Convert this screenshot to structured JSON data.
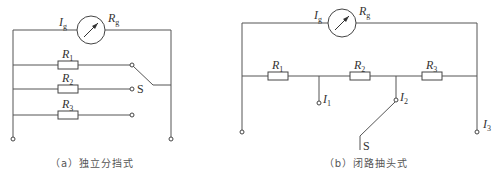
{
  "diagram_a": {
    "caption": "（a）独立分挡式",
    "galvanometer": {
      "current_label": "I",
      "current_sub": "g",
      "resistance_label": "R",
      "resistance_sub": "g"
    },
    "resistors": [
      {
        "label": "R",
        "sub": "1"
      },
      {
        "label": "R",
        "sub": "2"
      },
      {
        "label": "R",
        "sub": "3"
      }
    ],
    "switch_label": "S"
  },
  "diagram_b": {
    "caption": "（b）闭路抽头式",
    "galvanometer": {
      "current_label": "I",
      "current_sub": "g",
      "resistance_label": "R",
      "resistance_sub": "g"
    },
    "resistors": [
      {
        "label": "R",
        "sub": "1"
      },
      {
        "label": "R",
        "sub": "2"
      },
      {
        "label": "R",
        "sub": "3"
      }
    ],
    "taps": [
      {
        "label": "I",
        "sub": "1"
      },
      {
        "label": "I",
        "sub": "2"
      },
      {
        "label": "I",
        "sub": "3"
      }
    ],
    "switch_label": "S"
  },
  "colors": {
    "wire": "#555555",
    "text": "#333333",
    "caption": "#555555"
  }
}
